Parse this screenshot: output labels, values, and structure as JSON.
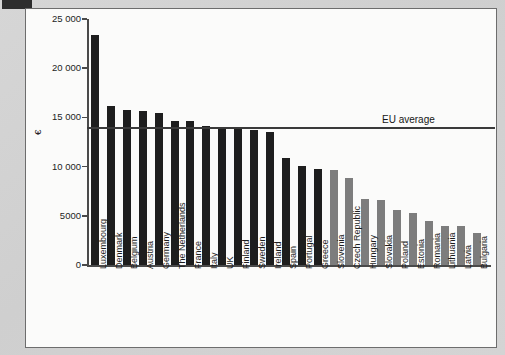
{
  "figure": {
    "yaxis_title": "€",
    "ytick_labels": [
      "25 000",
      "20 000",
      "15 000",
      "10 000",
      "5000",
      "0"
    ],
    "annotation_label": "EU average"
  },
  "chart_data": {
    "type": "bar",
    "title": "",
    "xlabel": "",
    "ylabel": "€",
    "ylim": [
      0,
      25000
    ],
    "yticks": [
      0,
      5000,
      10000,
      15000,
      20000,
      25000
    ],
    "grid": false,
    "legend": null,
    "annotations": [
      {
        "label": "EU average",
        "type": "hline",
        "value": 14000
      }
    ],
    "categories": [
      "Luxembourg",
      "Denmark",
      "Belgium",
      "Austria",
      "Germany",
      "The Netherlands",
      "France",
      "Italy",
      "UK",
      "Finland",
      "Sweden",
      "Ireland",
      "Spain",
      "Portugal",
      "Greece",
      "Slovenia",
      "Czech Republic",
      "Hungary",
      "Slovakia",
      "Poland",
      "Estonia",
      "Romania",
      "Lithuania",
      "Latvia",
      "Bulgaria"
    ],
    "values": [
      23400,
      16200,
      15800,
      15700,
      15400,
      14600,
      14600,
      14100,
      13900,
      13800,
      13700,
      13500,
      10900,
      10100,
      9800,
      9700,
      8800,
      6700,
      6600,
      5600,
      5300,
      4500,
      4000,
      4000,
      3300
    ],
    "bar_colors": [
      "#1e1e1e",
      "#1e1e1e",
      "#1e1e1e",
      "#1e1e1e",
      "#1e1e1e",
      "#1e1e1e",
      "#1e1e1e",
      "#1e1e1e",
      "#1e1e1e",
      "#1e1e1e",
      "#1e1e1e",
      "#1e1e1e",
      "#1e1e1e",
      "#1e1e1e",
      "#1e1e1e",
      "#7d7d7d",
      "#7d7d7d",
      "#7d7d7d",
      "#7d7d7d",
      "#7d7d7d",
      "#7d7d7d",
      "#7d7d7d",
      "#7d7d7d",
      "#7d7d7d",
      "#7d7d7d"
    ],
    "series_note": "Single series; dark bars = pre-2004 EU members, grey bars = newer member states"
  },
  "colors": {
    "page_background": "#d2d2d2",
    "panel_background": "#fbfbfa",
    "panel_border": "#6d6d6d",
    "axis": "#4a4a4a",
    "bar_dark": "#1e1e1e",
    "bar_grey": "#7d7d7d",
    "average_line": "#3a3a3a",
    "text": "#1d1d1d"
  }
}
